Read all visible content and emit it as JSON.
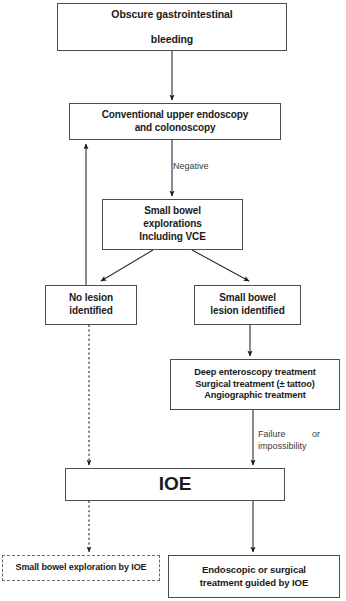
{
  "diagram": {
    "type": "flowchart",
    "accent_color": "#4d4d4d",
    "background_color": "#ffffff"
  },
  "nodes": {
    "obscure": {
      "line1": "Obscure gastrointestinal",
      "line2": "bleeding",
      "shape": "rectangle",
      "border": "solid"
    },
    "conventional": {
      "line1": "Conventional  upper endoscopy",
      "line2": "and colonoscopy",
      "shape": "rectangle",
      "border": "solid"
    },
    "explorations": {
      "line1": "Small bowel",
      "line2": "explorations",
      "line3": "Including VCE",
      "shape": "rectangle",
      "border": "solid"
    },
    "no_lesion": {
      "line1": "No lesion",
      "line2": "identified",
      "shape": "rectangle",
      "border": "solid"
    },
    "sb_lesion": {
      "line1": "Small bowel",
      "line2": "lesion identified",
      "shape": "rectangle",
      "border": "solid"
    },
    "treatment": {
      "line1": "Deep enteroscopy treatment",
      "line2": "Surgical treatment (± tattoo)",
      "line3": "Angiographic treatment",
      "shape": "rectangle",
      "border": "solid"
    },
    "ioe": {
      "line1": "IOE",
      "shape": "rectangle",
      "border": "solid"
    },
    "sb_exploration_ioe": {
      "line1": "Small bowel exploration by IOE",
      "shape": "rectangle",
      "border": "dashed"
    },
    "endoscopic": {
      "line1": "Endoscopic or surgical",
      "line2": "treatment guided by IOE",
      "shape": "rectangle",
      "border": "solid"
    }
  },
  "edge_labels": {
    "negative": "Negative",
    "failure": "Failure",
    "or": "or",
    "impossibility": "impossibility"
  },
  "edges": [
    {
      "from": "obscure",
      "to": "conventional",
      "style": "solid",
      "arrow": true
    },
    {
      "from": "conventional",
      "to": "explorations",
      "style": "solid",
      "arrow": true,
      "label": "Negative"
    },
    {
      "from": "explorations",
      "to": "no_lesion",
      "style": "solid",
      "arrow": true
    },
    {
      "from": "explorations",
      "to": "sb_lesion",
      "style": "solid",
      "arrow": true
    },
    {
      "from": "no_lesion",
      "to": "conventional",
      "style": "solid",
      "arrow": true,
      "direction": "up-feedback"
    },
    {
      "from": "no_lesion",
      "to": "ioe",
      "style": "dashed",
      "arrow": true
    },
    {
      "from": "sb_lesion",
      "to": "treatment",
      "style": "solid",
      "arrow": true
    },
    {
      "from": "treatment",
      "to": "ioe",
      "style": "solid",
      "arrow": true,
      "label": "Failure or impossibility"
    },
    {
      "from": "ioe",
      "to": "sb_exploration_ioe",
      "style": "dashed",
      "arrow": true
    },
    {
      "from": "ioe",
      "to": "endoscopic",
      "style": "solid",
      "arrow": true
    }
  ]
}
